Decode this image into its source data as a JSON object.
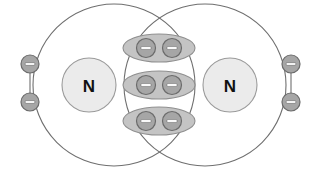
{
  "diagram": {
    "molecule": "N2",
    "bond_type": "triple bond",
    "canvas": {
      "width": 319,
      "height": 170,
      "background": "#ffffff"
    },
    "colors": {
      "shell_stroke": "#6f6f6f",
      "atom_fill": "#ebebeb",
      "atom_stroke": "#9a9a9a",
      "pair_fill": "#c4c4c4",
      "pair_stroke": "#8f8f8f",
      "electron_fill": "#a6a6a6",
      "electron_stroke": "#6b6b6b",
      "electron_sign_fill": "#ffffff",
      "label_color": "#111111"
    },
    "shells": [
      {
        "id": "left-shell",
        "cx": 114,
        "cy": 85,
        "r": 81
      },
      {
        "id": "right-shell",
        "cx": 205,
        "cy": 85,
        "r": 81
      }
    ],
    "atoms": [
      {
        "id": "atom-left",
        "symbol": "N",
        "cx": 89,
        "cy": 85,
        "r": 27
      },
      {
        "id": "atom-right",
        "symbol": "N",
        "cx": 230,
        "cy": 85,
        "r": 27
      }
    ],
    "lone_pairs": [
      {
        "id": "lone-pair-left",
        "side": "left",
        "electrons": [
          {
            "id": "lone-left-upper",
            "symbol": "−",
            "cx": 30,
            "cy": 64,
            "r": 9
          },
          {
            "id": "lone-left-lower",
            "symbol": "−",
            "cx": 30,
            "cy": 102,
            "r": 9
          }
        ]
      },
      {
        "id": "lone-pair-right",
        "side": "right",
        "electrons": [
          {
            "id": "lone-right-upper",
            "symbol": "−",
            "cx": 291,
            "cy": 64,
            "r": 9
          },
          {
            "id": "lone-right-lower",
            "symbol": "−",
            "cx": 291,
            "cy": 102,
            "r": 9
          }
        ]
      }
    ],
    "shared_pairs": [
      {
        "id": "shared-pair-top",
        "label": "shared electron pair 1",
        "cx": 159,
        "cy": 48,
        "rx": 36,
        "ry": 14,
        "electrons": [
          {
            "id": "shared-top-left",
            "symbol": "−",
            "cx": 146,
            "cy": 48,
            "r": 9.5
          },
          {
            "id": "shared-top-right",
            "symbol": "−",
            "cx": 172,
            "cy": 48,
            "r": 9.5
          }
        ]
      },
      {
        "id": "shared-pair-middle",
        "label": "shared electron pair 2",
        "cx": 159,
        "cy": 85,
        "rx": 36,
        "ry": 14,
        "electrons": [
          {
            "id": "shared-middle-left",
            "symbol": "−",
            "cx": 146,
            "cy": 85,
            "r": 9.5
          },
          {
            "id": "shared-middle-right",
            "symbol": "−",
            "cx": 172,
            "cy": 85,
            "r": 9.5
          }
        ]
      },
      {
        "id": "shared-pair-bottom",
        "label": "shared electron pair 3",
        "cx": 159,
        "cy": 121,
        "rx": 36,
        "ry": 14,
        "electrons": [
          {
            "id": "shared-bottom-left",
            "symbol": "−",
            "cx": 146,
            "cy": 121,
            "r": 9.5
          },
          {
            "id": "shared-bottom-right",
            "symbol": "−",
            "cx": 172,
            "cy": 121,
            "r": 9.5
          }
        ]
      }
    ],
    "labels": {
      "atom_left": "N",
      "atom_right": "N",
      "electron_symbol": "−"
    },
    "icon_names": {
      "electron": "electron-minus-icon",
      "atom": "atom-nucleus-icon",
      "shell": "electron-shell-icon",
      "pair": "shared-electron-pair-icon"
    }
  }
}
